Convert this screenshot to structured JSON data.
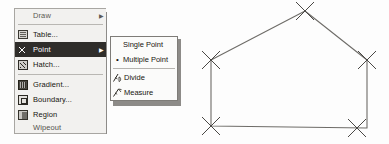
{
  "window": {
    "title": "AutoCAD Draw menu with Point submenu and point markers on a polyline"
  },
  "draw_menu": {
    "name": "Draw",
    "items": [
      {
        "id": "draw-truncated",
        "label": "Draw",
        "icon": "none",
        "state": "clipped",
        "has_submenu": true,
        "separator_after": false
      },
      {
        "id": "table",
        "label": "Table...",
        "icon": "table-icon",
        "state": "normal",
        "has_submenu": false,
        "separator_after": false
      },
      {
        "id": "point",
        "label": "Point",
        "icon": "point-icon",
        "state": "selected",
        "has_submenu": true,
        "separator_after": false
      },
      {
        "id": "hatch",
        "label": "Hatch...",
        "icon": "hatch-icon",
        "state": "normal",
        "has_submenu": false,
        "separator_after": true
      },
      {
        "id": "gradient",
        "label": "Gradient...",
        "icon": "gradient-icon",
        "state": "normal",
        "has_submenu": false,
        "separator_after": false
      },
      {
        "id": "boundary",
        "label": "Boundary...",
        "icon": "boundary-icon",
        "state": "normal",
        "has_submenu": false,
        "separator_after": false
      },
      {
        "id": "region",
        "label": "Region",
        "icon": "region-icon",
        "state": "normal",
        "has_submenu": false,
        "separator_after": false
      },
      {
        "id": "wipeout",
        "label": "Wipeout",
        "icon": "none",
        "state": "clipped",
        "has_submenu": false,
        "separator_after": false
      }
    ],
    "submenu_arrow": "▶"
  },
  "point_submenu": {
    "parent": "Point",
    "items": [
      {
        "id": "single-point",
        "label": "Single Point",
        "mark": "",
        "icon": "none",
        "separator_after": false
      },
      {
        "id": "multiple-point",
        "label": "Multiple Point",
        "mark": "•",
        "icon": "none",
        "separator_after": true
      },
      {
        "id": "divide",
        "label": "Divide",
        "mark": "",
        "icon": "divide-icon",
        "separator_after": false
      },
      {
        "id": "measure",
        "label": "Measure",
        "mark": "",
        "icon": "measure-icon",
        "separator_after": false
      }
    ]
  },
  "colors": {
    "menu_face": "#f2f1ef",
    "menu_border": "#a8a6a2",
    "highlight_bg": "#2f2d2a",
    "highlight_fg": "#ffffff",
    "text": "#17150f",
    "submenu_face": "#fbfbfa",
    "geometry_stroke": "#6e6c68",
    "marker_stroke": "#4a4845",
    "canvas": "#ffffff"
  },
  "cad_drawing": {
    "type": "polyline",
    "description": "Closed five-sided polygon (house outline) with X point markers placed at each vertex",
    "marker_style": "X",
    "marker_count": 5,
    "vertices": [
      {
        "id": "apex",
        "x": 115,
        "y": 11,
        "label": "apex"
      },
      {
        "id": "right-eave",
        "x": 177,
        "y": 60,
        "label": "right eave"
      },
      {
        "id": "right-base",
        "x": 177,
        "y": 128,
        "label": "right base"
      },
      {
        "id": "left-base",
        "x": 21,
        "y": 126,
        "label": "left base"
      },
      {
        "id": "left-eave",
        "x": 21,
        "y": 60,
        "label": "left eave"
      }
    ],
    "closed": true
  }
}
